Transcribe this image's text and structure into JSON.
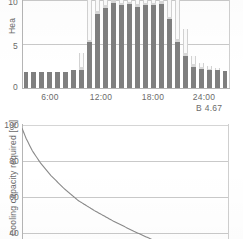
{
  "figure": {
    "caption": "B 4.67"
  },
  "top_chart": {
    "ylabel": "Hea",
    "yticks": [
      "10",
      "5",
      "0"
    ],
    "xticks": [
      "6:00",
      "12:00",
      "18:00",
      "24:00"
    ]
  },
  "bottom_chart": {
    "ylabel": "Cooling capacity required [%]",
    "yticks": [
      "100",
      "80",
      "60",
      "40"
    ]
  },
  "chart_data": [
    {
      "type": "bar",
      "title": "",
      "xlabel": "",
      "ylabel": "Hea",
      "ylim": [
        0,
        12.5
      ],
      "xlim": [
        0,
        24
      ],
      "grid": true,
      "stacked": true,
      "note": "Top of plot is cropped by the screenshot frame; several bars extend above the visible area.",
      "categories": [
        "0:00",
        "1:00",
        "2:00",
        "3:00",
        "4:00",
        "5:00",
        "6:00",
        "7:00",
        "8:00",
        "9:00",
        "10:00",
        "11:00",
        "12:00",
        "13:00",
        "14:00",
        "15:00",
        "16:00",
        "17:00",
        "18:00",
        "19:00",
        "20:00",
        "21:00",
        "22:00",
        "23:00"
      ],
      "series": [
        {
          "name": "base load",
          "color": "#7f7f7f",
          "values": [
            1.8,
            1.8,
            1.8,
            1.8,
            1.8,
            1.8,
            2.1,
            2.1,
            5.2,
            8.4,
            9.1,
            9.7,
            9.4,
            9.5,
            9.2,
            9.4,
            9.4,
            9.6,
            7.8,
            5.2,
            3.6,
            2.4,
            2.2,
            2.1,
            2.0,
            1.9
          ]
        },
        {
          "name": "mid load",
          "color": "#d8d8d8",
          "values": [
            0,
            0,
            0,
            0,
            0,
            0,
            0,
            0.3,
            0.3,
            0.3,
            0.3,
            0.3,
            0.3,
            0.3,
            0.3,
            0.3,
            0.3,
            0.3,
            0.3,
            0.4,
            0.4,
            0.3,
            0.2,
            0.1,
            0.1,
            0
          ]
        },
        {
          "name": "peak load",
          "color": "#fbfbfb",
          "values": [
            0,
            0,
            0,
            0,
            0,
            0,
            0,
            1.6,
            6.8,
            4.3,
            3.4,
            2.8,
            3.1,
            3.0,
            3.3,
            3.1,
            3.1,
            2.9,
            4.7,
            6.3,
            2.7,
            0.9,
            0.5,
            0.3,
            0.2,
            0
          ]
        }
      ],
      "yticks": [
        0,
        5,
        10
      ],
      "xtick_labels": [
        "6:00",
        "12:00",
        "18:00",
        "24:00"
      ],
      "xtick_values": [
        6,
        12,
        18,
        24
      ]
    },
    {
      "type": "line",
      "title": "",
      "xlabel": "",
      "ylabel": "Cooling capacity required [%]",
      "ylim": [
        38,
        102
      ],
      "xlim": [
        0,
        100
      ],
      "grid": true,
      "yticks": [
        100,
        80,
        60,
        40
      ],
      "series": [
        {
          "name": "cooling capacity required",
          "color": "#8a8a8a",
          "x": [
            0,
            2,
            5,
            9,
            14,
            20,
            27,
            35,
            44,
            54,
            65,
            77,
            90,
            100
          ],
          "y": [
            100,
            95,
            89,
            83,
            77,
            71,
            65,
            60,
            55,
            50,
            45,
            41,
            38,
            36
          ]
        }
      ]
    }
  ]
}
